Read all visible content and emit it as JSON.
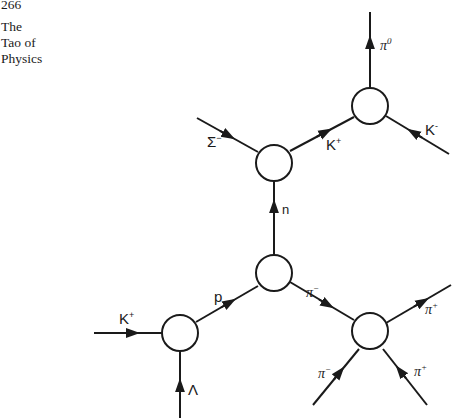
{
  "page": {
    "number": "266",
    "book_title_lines": [
      "The",
      "Tao of",
      "Physics"
    ]
  },
  "diagram": {
    "type": "S-matrix particle interaction diagram",
    "vertices": [
      {
        "id": "v1",
        "description": "bottom-left reaction circle"
      },
      {
        "id": "v2",
        "description": "central reaction circle"
      },
      {
        "id": "v3",
        "description": "upper-middle reaction circle"
      },
      {
        "id": "v4",
        "description": "top-right reaction circle"
      },
      {
        "id": "v5",
        "description": "bottom-right reaction circle"
      }
    ],
    "lines": {
      "k_plus_in": {
        "base": "K",
        "sup": "+",
        "from": "left",
        "to": "v1"
      },
      "lambda": {
        "base": "Λ",
        "sup": "",
        "from": "bottom",
        "to": "v1"
      },
      "proton": {
        "base": "p",
        "sup": "",
        "from": "v1",
        "to": "v2"
      },
      "neutron": {
        "base": "n",
        "sup": "",
        "from": "v2",
        "to": "v3"
      },
      "pi_minus_mid": {
        "base": "π",
        "sup": "−",
        "from": "v5",
        "to": "v2"
      },
      "sigma_minus": {
        "base": "Σ",
        "sup": "−",
        "from": "v3",
        "to": "upper-left"
      },
      "k_plus_upper": {
        "base": "K",
        "sup": "+",
        "from": "v3",
        "to": "v4"
      },
      "pi_zero": {
        "base": "π",
        "sup": "0",
        "from": "v4",
        "to": "top"
      },
      "k_minus": {
        "base": "K",
        "sup": "-",
        "from": "lower-right",
        "to": "v4"
      },
      "pi_plus_out": {
        "base": "π",
        "sup": "+",
        "from": "v5",
        "to": "upper-right"
      },
      "pi_minus_in": {
        "base": "π",
        "sup": "−",
        "from": "lower-left",
        "to": "v5"
      },
      "pi_plus_in": {
        "base": "π",
        "sup": "+",
        "from": "lower-right",
        "to": "v5"
      }
    },
    "stroke_color": "#1a1a1a",
    "background": "#ffffff"
  }
}
